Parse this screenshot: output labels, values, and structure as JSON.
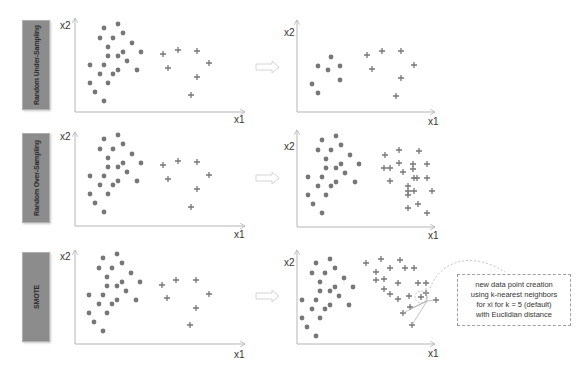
{
  "colors": {
    "point": "#777777",
    "axis": "#b5b5b5",
    "label_bg": "#8c8c8c",
    "arrow": "#d8d8d8"
  },
  "rows": [
    {
      "label": "Random Under-Sampling",
      "top": 20,
      "label_h": 88
    },
    {
      "label": "Random Over-Sampling",
      "top": 132,
      "label_h": 88
    },
    {
      "label": "SMOTE",
      "top": 250,
      "label_h": 88
    }
  ],
  "axes": {
    "x": "x1",
    "y": "x2"
  },
  "callout": {
    "lines": [
      "new data point creation",
      "using k-nearest neighbors",
      "for xi for k = 5  (default)",
      "with Euclidian distance"
    ]
  },
  "chart_data": {
    "type": "scatter",
    "panels": [
      {
        "row": "Random Under-Sampling",
        "side": "before",
        "majority_dots": [
          [
            104,
            28
          ],
          [
            118,
            24
          ],
          [
            100,
            38
          ],
          [
            113,
            38
          ],
          [
            123,
            33
          ],
          [
            108,
            47
          ],
          [
            132,
            43
          ],
          [
            108,
            56
          ],
          [
            118,
            56
          ],
          [
            123,
            52
          ],
          [
            141,
            52
          ],
          [
            127,
            61
          ],
          [
            90,
            65
          ],
          [
            104,
            65
          ],
          [
            100,
            74
          ],
          [
            113,
            74
          ],
          [
            118,
            70
          ],
          [
            137,
            70
          ],
          [
            90,
            83
          ],
          [
            95,
            92
          ],
          [
            108,
            83
          ],
          [
            104,
            101
          ]
        ],
        "minority_plus": [
          [
            163,
            54
          ],
          [
            178,
            50
          ],
          [
            197,
            51
          ],
          [
            168,
            68
          ],
          [
            209,
            63
          ],
          [
            197,
            77
          ],
          [
            191,
            95
          ]
        ]
      },
      {
        "row": "Random Under-Sampling",
        "side": "after",
        "majority_dots": [
          [
            331,
            57
          ],
          [
            318,
            66
          ],
          [
            328,
            70
          ],
          [
            340,
            66
          ],
          [
            340,
            80
          ],
          [
            312,
            84
          ],
          [
            318,
            93
          ]
        ],
        "minority_plus": [
          [
            367,
            55
          ],
          [
            382,
            51
          ],
          [
            401,
            51
          ],
          [
            372,
            69
          ],
          [
            414,
            65
          ],
          [
            401,
            78
          ],
          [
            396,
            96
          ]
        ]
      },
      {
        "row": "Random Over-Sampling",
        "side": "before",
        "minority_plus": [
          [
            163,
            165
          ],
          [
            178,
            161
          ],
          [
            197,
            162
          ],
          [
            168,
            179
          ],
          [
            209,
            175
          ],
          [
            197,
            189
          ],
          [
            191,
            207
          ]
        ]
      },
      {
        "row": "Random Over-Sampling",
        "side": "after",
        "minority_plus_count": 28
      },
      {
        "row": "SMOTE",
        "side": "before",
        "minority_plus": [
          [
            162,
            285
          ],
          [
            176,
            280
          ],
          [
            196,
            280
          ],
          [
            167,
            298
          ],
          [
            209,
            294
          ],
          [
            196,
            308
          ],
          [
            190,
            325
          ]
        ]
      },
      {
        "row": "SMOTE",
        "side": "after",
        "minority_plus_count": 26,
        "annotation": "new data point creation using k-nearest neighbors for xi for k = 5 (default) with Euclidian distance"
      }
    ],
    "legend": [
      {
        "marker": "dot",
        "meaning": "majority class"
      },
      {
        "marker": "plus",
        "meaning": "minority class"
      }
    ]
  }
}
